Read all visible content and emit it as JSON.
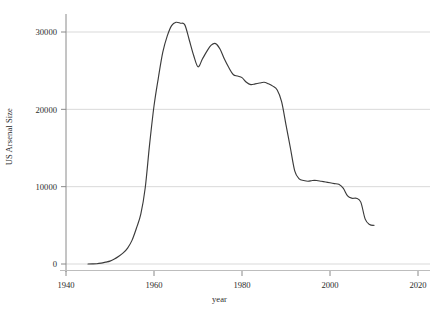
{
  "chart_data": {
    "type": "line",
    "title": "",
    "subtitle": "",
    "xlabel": "year",
    "ylabel": "US Arsenal Size",
    "xlim": [
      1940,
      2020
    ],
    "ylim": [
      0,
      32500
    ],
    "grid": "horizontal",
    "legend": "none",
    "line_color": "#3b3b3b",
    "grid_color": "#d9d9d9",
    "axis_color": "#808080",
    "xticks": [
      1940,
      1960,
      1980,
      2000,
      2020
    ],
    "xticklabels": [
      "1940",
      "1960",
      "1980",
      "2000",
      "2020"
    ],
    "yticks": [
      0,
      10000,
      20000,
      30000
    ],
    "yticklabels": [
      "0",
      "10000",
      "20000",
      "30000"
    ],
    "series": [
      {
        "name": "US Arsenal Size",
        "x": [
          1945,
          1946,
          1947,
          1948,
          1949,
          1950,
          1951,
          1952,
          1953,
          1954,
          1955,
          1956,
          1957,
          1958,
          1959,
          1960,
          1961,
          1962,
          1963,
          1964,
          1965,
          1966,
          1967,
          1968,
          1969,
          1970,
          1971,
          1972,
          1973,
          1974,
          1975,
          1976,
          1977,
          1978,
          1979,
          1980,
          1981,
          1982,
          1983,
          1984,
          1985,
          1986,
          1987,
          1988,
          1989,
          1990,
          1991,
          1992,
          1993,
          1994,
          1995,
          1996,
          1997,
          1998,
          1999,
          2000,
          2001,
          2002,
          2003,
          2004,
          2005,
          2006,
          2007,
          2008,
          2009,
          2010
        ],
        "values": [
          6,
          11,
          32,
          110,
          235,
          369,
          640,
          1005,
          1436,
          2063,
          3057,
          4618,
          6444,
          9822,
          15468,
          20434,
          24111,
          27387,
          29459,
          30817,
          31255,
          31139,
          30921,
          28999,
          27000,
          25500,
          26500,
          27500,
          28300,
          28500,
          27800,
          26500,
          25400,
          24500,
          24300,
          24100,
          23500,
          23200,
          23300,
          23400,
          23500,
          23300,
          23000,
          22500,
          21000,
          18000,
          15000,
          12000,
          11000,
          10800,
          10700,
          10800,
          10800,
          10700,
          10600,
          10500,
          10400,
          10300,
          9800,
          8800,
          8500,
          8500,
          8000,
          5800,
          5100,
          5000
        ]
      }
    ]
  },
  "axes": {
    "ylabel": "US Arsenal Size",
    "xlabel": "year"
  }
}
